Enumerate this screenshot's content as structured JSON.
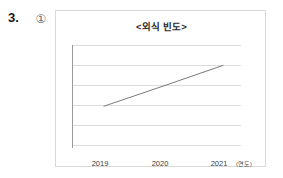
{
  "question": {
    "number": "3.",
    "choice_marker": "①"
  },
  "figure": {
    "title": "<외식 빈도>"
  },
  "chart_data": {
    "type": "line",
    "title": "<외식 빈도>",
    "xlabel": "(연도)",
    "ylabel": "",
    "categories": [
      "2019",
      "2020",
      "2021"
    ],
    "x_tick_labels": [
      "2019",
      "2020",
      "2021"
    ],
    "axis_unit_label": "(연도)",
    "series": [
      {
        "name": "외식 빈도",
        "values": [
          2,
          3,
          4
        ],
        "color": "#6b6b6b"
      }
    ],
    "ylim": [
      0,
      5
    ],
    "y_gridline_values": [
      5,
      4,
      3,
      2,
      1,
      0
    ],
    "grid": true,
    "y_axis_ticks_shown": false,
    "legend": "none",
    "trend": "increasing"
  },
  "colors": {
    "card_border": "#d8d8d8",
    "gridline": "#dcdcdc",
    "axis": "#9a9a9a",
    "line": "#6b6b6b",
    "text": "#2a2a2a",
    "background": "#ffffff"
  }
}
